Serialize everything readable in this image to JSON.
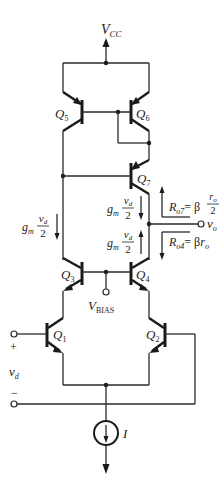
{
  "diagram": {
    "supply": {
      "label": "V",
      "sub": "CC"
    },
    "bias": {
      "label": "V",
      "sub": "BIAS"
    },
    "transistors": [
      {
        "id": "Q5",
        "label": "Q",
        "sub": "5"
      },
      {
        "id": "Q6",
        "label": "Q",
        "sub": "6"
      },
      {
        "id": "Q7",
        "label": "Q",
        "sub": "7"
      },
      {
        "id": "Q3",
        "label": "Q",
        "sub": "3"
      },
      {
        "id": "Q4",
        "label": "Q",
        "sub": "4"
      },
      {
        "id": "Q1",
        "label": "Q",
        "sub": "1"
      },
      {
        "id": "Q2",
        "label": "Q",
        "sub": "2"
      }
    ],
    "currents": {
      "left": {
        "gm": "g",
        "gm_sub": "m",
        "num": "v",
        "num_sub": "d",
        "den": "2"
      },
      "q7": {
        "gm": "g",
        "gm_sub": "m",
        "num": "v",
        "num_sub": "d",
        "den": "2"
      },
      "q4": {
        "gm": "g",
        "gm_sub": "m",
        "num": "v",
        "num_sub": "d",
        "den": "2"
      }
    },
    "resistances": {
      "ro7": {
        "lhs": "R",
        "lhs_sub": "o7",
        "eq": "= β",
        "num": "r",
        "num_sub": "o",
        "den": "2"
      },
      "ro4": {
        "lhs": "R",
        "lhs_sub": "o4",
        "eq": "= β",
        "rhs": "r",
        "rhs_sub": "o"
      }
    },
    "output": {
      "label": "v",
      "sub": "o"
    },
    "input": {
      "label": "v",
      "sub": "d",
      "plus": "+",
      "minus": "−"
    },
    "current_source": {
      "label": "I"
    }
  }
}
